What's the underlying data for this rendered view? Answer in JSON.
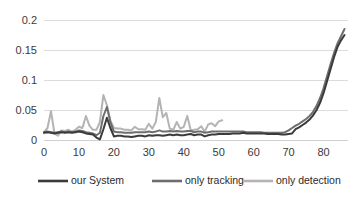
{
  "chart_data": {
    "type": "line",
    "title": "",
    "xlabel": "",
    "ylabel": "",
    "xlim": [
      0,
      87
    ],
    "ylim": [
      0,
      0.21
    ],
    "grid": true,
    "grid_axis": "y",
    "legend_position": "bottom",
    "y_ticks": [
      "0",
      "0.05",
      "0.1",
      "0.15",
      "0.2"
    ],
    "y_tick_values": [
      0,
      0.05,
      0.1,
      0.15,
      0.2
    ],
    "x_ticks": [
      "0",
      "10",
      "20",
      "30",
      "40",
      "50",
      "60",
      "70",
      "80"
    ],
    "x_tick_values": [
      0,
      10,
      20,
      30,
      40,
      50,
      60,
      70,
      80
    ],
    "series": [
      {
        "name": "our System",
        "color": "#3b3b3b",
        "width": 2.0,
        "x": [
          0,
          1,
          2,
          3,
          4,
          5,
          6,
          7,
          8,
          9,
          10,
          11,
          12,
          13,
          14,
          15,
          16,
          17,
          18,
          19,
          20,
          21,
          22,
          23,
          24,
          25,
          26,
          27,
          28,
          29,
          30,
          31,
          32,
          33,
          34,
          35,
          36,
          37,
          38,
          39,
          40,
          41,
          42,
          43,
          44,
          45,
          46,
          47,
          48,
          49,
          50,
          51,
          52,
          53,
          54,
          55,
          56,
          57,
          58,
          59,
          60,
          61,
          62,
          63,
          64,
          65,
          66,
          67,
          68,
          69,
          70,
          71,
          72,
          73,
          74,
          75,
          76,
          77,
          78,
          79,
          80,
          81,
          82,
          83,
          84,
          85,
          86
        ],
        "values": [
          0.012,
          0.013,
          0.012,
          0.011,
          0.012,
          0.013,
          0.012,
          0.013,
          0.012,
          0.013,
          0.014,
          0.013,
          0.011,
          0.01,
          0.009,
          0.004,
          0.001,
          0.018,
          0.037,
          0.02,
          0.006,
          0.007,
          0.007,
          0.006,
          0.006,
          0.005,
          0.006,
          0.007,
          0.007,
          0.006,
          0.008,
          0.007,
          0.008,
          0.008,
          0.007,
          0.008,
          0.009,
          0.008,
          0.009,
          0.008,
          0.008,
          0.009,
          0.01,
          0.008,
          0.009,
          0.009,
          0.006,
          0.008,
          0.009,
          0.009,
          0.01,
          0.01,
          0.01,
          0.01,
          0.011,
          0.011,
          0.011,
          0.012,
          0.011,
          0.011,
          0.011,
          0.011,
          0.011,
          0.011,
          0.01,
          0.01,
          0.01,
          0.01,
          0.009,
          0.009,
          0.01,
          0.011,
          0.018,
          0.021,
          0.025,
          0.029,
          0.034,
          0.041,
          0.05,
          0.062,
          0.078,
          0.098,
          0.118,
          0.138,
          0.155,
          0.166,
          0.175
        ]
      },
      {
        "name": "only tracking",
        "color": "#6e6e6e",
        "width": 2.0,
        "x": [
          0,
          1,
          2,
          3,
          4,
          5,
          6,
          7,
          8,
          9,
          10,
          11,
          12,
          13,
          14,
          15,
          16,
          17,
          18,
          19,
          20,
          21,
          22,
          23,
          24,
          25,
          26,
          27,
          28,
          29,
          30,
          31,
          32,
          33,
          34,
          35,
          36,
          37,
          38,
          39,
          40,
          41,
          42,
          43,
          44,
          45,
          46,
          47,
          48,
          49,
          50,
          51,
          52,
          53,
          54,
          55,
          56,
          57,
          58,
          59,
          60,
          61,
          62,
          63,
          64,
          65,
          66,
          67,
          68,
          69,
          70,
          71,
          72,
          73,
          74,
          75,
          76,
          77,
          78,
          79,
          80,
          81,
          82,
          83,
          84,
          85,
          86
        ],
        "values": [
          0.013,
          0.014,
          0.013,
          0.012,
          0.013,
          0.014,
          0.013,
          0.014,
          0.013,
          0.014,
          0.016,
          0.015,
          0.013,
          0.012,
          0.011,
          0.008,
          0.012,
          0.04,
          0.055,
          0.03,
          0.014,
          0.013,
          0.013,
          0.012,
          0.012,
          0.012,
          0.013,
          0.013,
          0.013,
          0.013,
          0.014,
          0.013,
          0.014,
          0.016,
          0.014,
          0.014,
          0.015,
          0.014,
          0.015,
          0.014,
          0.014,
          0.015,
          0.015,
          0.013,
          0.014,
          0.014,
          0.012,
          0.013,
          0.014,
          0.014,
          0.014,
          0.014,
          0.014,
          0.014,
          0.014,
          0.014,
          0.014,
          0.014,
          0.013,
          0.013,
          0.013,
          0.013,
          0.013,
          0.012,
          0.012,
          0.012,
          0.012,
          0.012,
          0.012,
          0.013,
          0.016,
          0.02,
          0.024,
          0.027,
          0.031,
          0.035,
          0.04,
          0.047,
          0.057,
          0.07,
          0.086,
          0.106,
          0.126,
          0.145,
          0.161,
          0.173,
          0.185
        ]
      },
      {
        "name": "only detection",
        "color": "#b4b4b4",
        "width": 2.0,
        "x": [
          0,
          1,
          2,
          3,
          4,
          5,
          6,
          7,
          8,
          9,
          10,
          11,
          12,
          13,
          14,
          15,
          16,
          17,
          18,
          19,
          20,
          21,
          22,
          23,
          24,
          25,
          26,
          27,
          28,
          29,
          30,
          31,
          32,
          33,
          34,
          35,
          36,
          37,
          38,
          39,
          40,
          41,
          42,
          43,
          44,
          45,
          46,
          47,
          48,
          49,
          50,
          51
        ],
        "values": [
          0.013,
          0.02,
          0.048,
          0.011,
          0.007,
          0.016,
          0.015,
          0.017,
          0.014,
          0.017,
          0.022,
          0.02,
          0.04,
          0.024,
          0.017,
          0.017,
          0.03,
          0.075,
          0.058,
          0.032,
          0.02,
          0.019,
          0.019,
          0.017,
          0.017,
          0.016,
          0.022,
          0.018,
          0.018,
          0.017,
          0.027,
          0.019,
          0.03,
          0.07,
          0.038,
          0.045,
          0.019,
          0.017,
          0.03,
          0.019,
          0.022,
          0.04,
          0.016,
          0.017,
          0.018,
          0.023,
          0.014,
          0.026,
          0.028,
          0.023,
          0.031,
          0.033
        ]
      }
    ]
  },
  "legend": {
    "items": [
      {
        "label": "our System",
        "color": "#3b3b3b"
      },
      {
        "label": "only tracking",
        "color": "#6e6e6e"
      },
      {
        "label": "only detection",
        "color": "#b4b4b4"
      }
    ]
  },
  "axes": {
    "gridline_color": "#dcdcdc",
    "axis_color": "#d0d0d0",
    "tick_text_color": "#3a3a3a"
  }
}
